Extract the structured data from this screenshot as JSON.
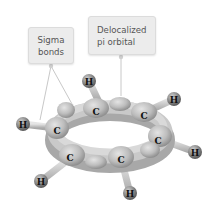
{
  "diagram": {
    "callouts": [
      {
        "id": "sigma",
        "lines": [
          "Sigma",
          "bonds"
        ]
      },
      {
        "id": "pi",
        "lines": [
          "Delocalized",
          "pi orbital"
        ]
      }
    ],
    "atoms": {
      "hydrogen_label": "H",
      "carbon_label": "C",
      "hydrogen": [
        {
          "x": 89,
          "y": 81
        },
        {
          "x": 174,
          "y": 99
        },
        {
          "x": 23,
          "y": 124
        },
        {
          "x": 195,
          "y": 152
        },
        {
          "x": 41,
          "y": 181
        },
        {
          "x": 130,
          "y": 193
        }
      ],
      "carbon": [
        {
          "x": 96,
          "y": 112
        },
        {
          "x": 144,
          "y": 116
        },
        {
          "x": 57,
          "y": 131
        },
        {
          "x": 158,
          "y": 141
        },
        {
          "x": 70,
          "y": 158
        },
        {
          "x": 121,
          "y": 160
        }
      ]
    },
    "colors": {
      "callout_bg": "#ececec",
      "callout_text": "#555555",
      "leader_line": "#c8c8c8",
      "orbital": "#b8b8b8",
      "hydrogen": "#8a8a8a"
    }
  }
}
